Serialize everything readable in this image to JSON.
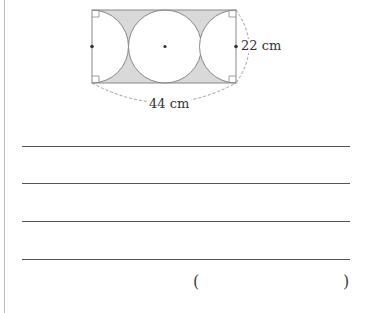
{
  "figure": {
    "width_label": "44 cm",
    "height_label": "22 cm",
    "shade_color": "#d9d9d9",
    "stroke_color": "#888888"
  },
  "answer": {
    "line_count": 4,
    "open_paren": "(",
    "close_paren": ")"
  }
}
